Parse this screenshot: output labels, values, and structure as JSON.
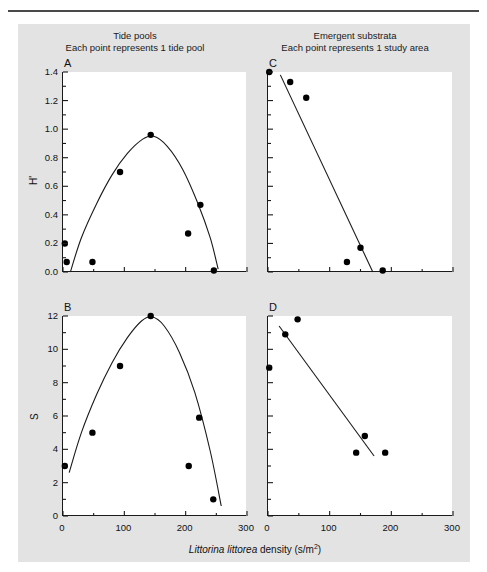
{
  "figure": {
    "background_color": "#e3e3e3",
    "plot_background_color": "#ffffff",
    "axis_color": "#1a1a1a",
    "point_color": "#000000",
    "column_headings": [
      {
        "line1": "Tide pools",
        "line2": "Each point represents 1 tide pool"
      },
      {
        "line1": "Emergent substrata",
        "line2": "Each point represents 1 study area"
      }
    ],
    "xaxis_caption_parts": {
      "genus": "Littorina",
      "species": "littorea",
      "rest": " density (s/m",
      "exponent": "2",
      "close": ")"
    }
  },
  "chart_data": [
    {
      "type": "scatter",
      "panel": "A",
      "title": "Tide pools",
      "subtitle": "Each point represents 1 tide pool",
      "xlabel": "Littorina littorea density (s/m2)",
      "ylabel": "H'",
      "xlim": [
        0,
        300
      ],
      "ylim": [
        0,
        1.4
      ],
      "xticks": [
        0,
        100,
        200,
        300
      ],
      "xtick_labels": [
        "0",
        "100",
        "200",
        "300"
      ],
      "xminor_interval": 50,
      "yticks": [
        0.0,
        0.2,
        0.4,
        0.6,
        0.8,
        1.0,
        1.2,
        1.4
      ],
      "ytick_labels": [
        "0.0",
        "0.2",
        "0.4",
        "0.6",
        "0.8",
        "1.0",
        "1.2",
        "1.4"
      ],
      "yminor_interval": 0.1,
      "grid": false,
      "legend": "none",
      "points": [
        {
          "x": 3,
          "y": 0.2
        },
        {
          "x": 6,
          "y": 0.07
        },
        {
          "x": 48,
          "y": 0.07
        },
        {
          "x": 93,
          "y": 0.7
        },
        {
          "x": 143,
          "y": 0.96
        },
        {
          "x": 204,
          "y": 0.27
        },
        {
          "x": 224,
          "y": 0.47
        },
        {
          "x": 246,
          "y": 0.01
        }
      ],
      "fit_curve": {
        "shape": "quadratic-hump",
        "points": [
          {
            "x": 12,
            "y": 0.0
          },
          {
            "x": 30,
            "y": 0.24
          },
          {
            "x": 55,
            "y": 0.48
          },
          {
            "x": 80,
            "y": 0.68
          },
          {
            "x": 105,
            "y": 0.83
          },
          {
            "x": 130,
            "y": 0.93
          },
          {
            "x": 148,
            "y": 0.95
          },
          {
            "x": 170,
            "y": 0.88
          },
          {
            "x": 195,
            "y": 0.72
          },
          {
            "x": 220,
            "y": 0.48
          },
          {
            "x": 240,
            "y": 0.24
          },
          {
            "x": 253,
            "y": 0.02
          }
        ]
      }
    },
    {
      "type": "scatter",
      "panel": "B",
      "title": "Tide pools",
      "subtitle": "Each point represents 1 tide pool",
      "xlabel": "Littorina littorea density (s/m2)",
      "ylabel": "S",
      "xlim": [
        0,
        300
      ],
      "ylim": [
        0,
        12
      ],
      "xticks": [
        0,
        100,
        200,
        300
      ],
      "xtick_labels": [
        "0",
        "100",
        "200",
        "300"
      ],
      "xminor_interval": 50,
      "yticks": [
        0,
        2,
        4,
        6,
        8,
        10,
        12
      ],
      "ytick_labels": [
        "0",
        "2",
        "4",
        "6",
        "8",
        "10",
        "12"
      ],
      "yminor_interval": 1,
      "grid": false,
      "legend": "none",
      "points": [
        {
          "x": 3,
          "y": 3.0
        },
        {
          "x": 48,
          "y": 5.0
        },
        {
          "x": 93,
          "y": 9.0
        },
        {
          "x": 143,
          "y": 12.0
        },
        {
          "x": 205,
          "y": 3.0
        },
        {
          "x": 222,
          "y": 5.9
        },
        {
          "x": 245,
          "y": 1.0
        }
      ],
      "fit_curve": {
        "shape": "quadratic-hump",
        "points": [
          {
            "x": 10,
            "y": 2.6
          },
          {
            "x": 30,
            "y": 5.0
          },
          {
            "x": 55,
            "y": 7.3
          },
          {
            "x": 80,
            "y": 9.2
          },
          {
            "x": 105,
            "y": 10.7
          },
          {
            "x": 128,
            "y": 11.7
          },
          {
            "x": 145,
            "y": 11.95
          },
          {
            "x": 165,
            "y": 11.4
          },
          {
            "x": 190,
            "y": 9.8
          },
          {
            "x": 215,
            "y": 7.4
          },
          {
            "x": 240,
            "y": 3.9
          },
          {
            "x": 258,
            "y": 0.6
          }
        ]
      }
    },
    {
      "type": "scatter",
      "panel": "C",
      "title": "Emergent substrata",
      "subtitle": "Each point represents 1 study area",
      "xlabel": "Littorina littorea density (s/m2)",
      "ylabel": "H'",
      "xlim": [
        0,
        300
      ],
      "ylim": [
        0,
        1.4
      ],
      "xticks": [
        0,
        100,
        200,
        300
      ],
      "xtick_labels": [
        "0",
        "100",
        "200",
        "300"
      ],
      "xminor_interval": 50,
      "yticks": [
        0.0,
        0.2,
        0.4,
        0.6,
        0.8,
        1.0,
        1.2,
        1.4
      ],
      "ytick_labels": [],
      "yminor_interval": 0.1,
      "grid": false,
      "legend": "none",
      "points": [
        {
          "x": 2,
          "y": 1.4
        },
        {
          "x": 36,
          "y": 1.33
        },
        {
          "x": 62,
          "y": 1.22
        },
        {
          "x": 128,
          "y": 0.07
        },
        {
          "x": 150,
          "y": 0.17
        },
        {
          "x": 186,
          "y": 0.01
        }
      ],
      "fit_curve": {
        "shape": "linear",
        "points": [
          {
            "x": 20,
            "y": 1.38
          },
          {
            "x": 170,
            "y": 0.0
          }
        ]
      }
    },
    {
      "type": "scatter",
      "panel": "D",
      "title": "Emergent substrata",
      "subtitle": "Each point represents 1 study area",
      "xlabel": "Littorina littorea density (s/m2)",
      "ylabel": "S",
      "xlim": [
        0,
        300
      ],
      "ylim": [
        0,
        12
      ],
      "xticks": [
        0,
        100,
        200,
        300
      ],
      "xtick_labels": [
        "0",
        "100",
        "200",
        "300"
      ],
      "xminor_interval": 50,
      "yticks": [
        0,
        2,
        4,
        6,
        8,
        10,
        12
      ],
      "ytick_labels": [],
      "yminor_interval": 1,
      "grid": false,
      "legend": "none",
      "points": [
        {
          "x": 2,
          "y": 8.9
        },
        {
          "x": 28,
          "y": 10.9
        },
        {
          "x": 48,
          "y": 11.8
        },
        {
          "x": 143,
          "y": 3.8
        },
        {
          "x": 157,
          "y": 4.8
        },
        {
          "x": 190,
          "y": 3.8
        }
      ],
      "fit_curve": {
        "shape": "linear",
        "points": [
          {
            "x": 18,
            "y": 11.4
          },
          {
            "x": 172,
            "y": 3.6
          }
        ]
      }
    }
  ]
}
